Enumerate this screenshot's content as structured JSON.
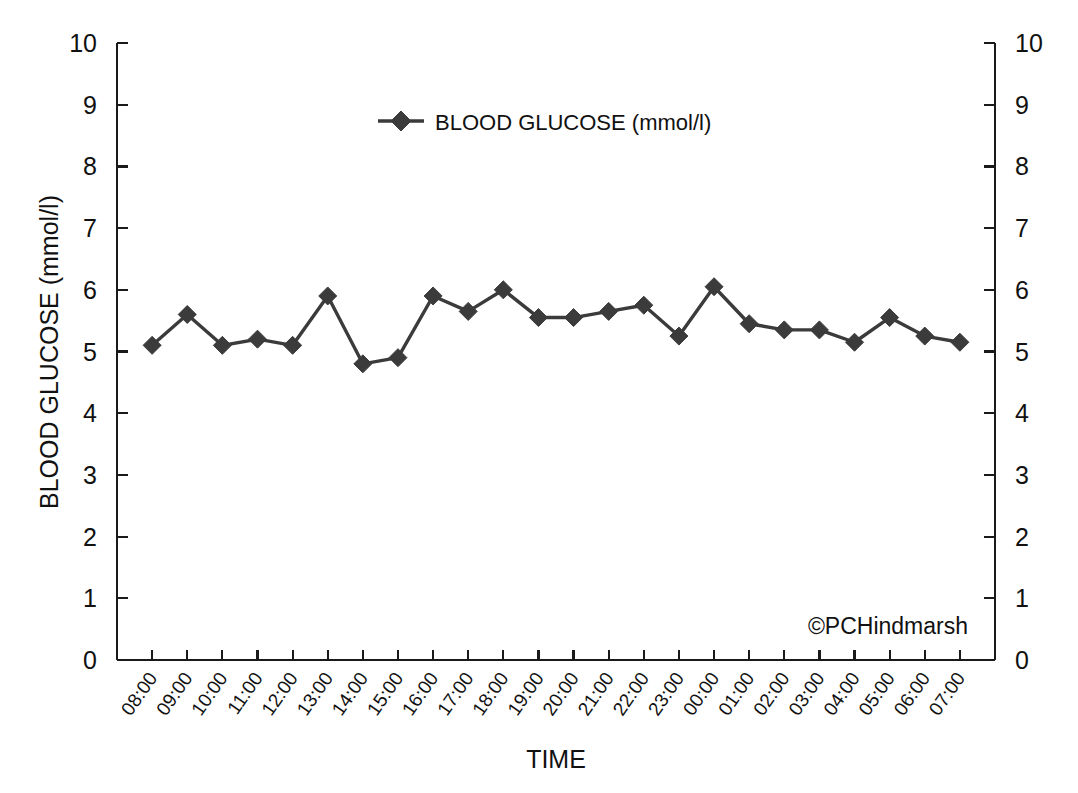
{
  "chart_data": {
    "type": "line",
    "title": "",
    "xlabel": "TIME",
    "ylabel": "BLOOD GLUCOSE (mmol/l)",
    "ylabel_right": "BLOOD GLUCOSE (mmol/l)",
    "ylim": [
      0,
      10
    ],
    "y_ticks": [
      0,
      1,
      2,
      3,
      4,
      5,
      6,
      7,
      8,
      9,
      10
    ],
    "y_tick_labels": [
      "0",
      "1",
      "2",
      "3",
      "4",
      "5",
      "6",
      "7",
      "8",
      "9",
      "10"
    ],
    "dual_y_axis": true,
    "grid": false,
    "legend_position": "top-center",
    "marker": "diamond",
    "line_color": "#3b3b3b",
    "categories": [
      "08:00",
      "09:00",
      "10:00",
      "11:00",
      "12:00",
      "13:00",
      "14:00",
      "15:00",
      "16:00",
      "17:00",
      "18:00",
      "19:00",
      "20:00",
      "21:00",
      "22:00",
      "23:00",
      "00:00",
      "01:00",
      "02:00",
      "03:00",
      "04:00",
      "05:00",
      "06:00",
      "07:00"
    ],
    "series": [
      {
        "name": "BLOOD GLUCOSE (mmol/l)",
        "values": [
          5.1,
          5.6,
          5.1,
          5.2,
          5.1,
          5.9,
          4.8,
          4.9,
          5.9,
          5.65,
          6.0,
          5.55,
          5.55,
          5.65,
          5.75,
          5.25,
          6.05,
          5.45,
          5.35,
          5.35,
          5.15,
          5.55,
          5.25,
          5.15
        ]
      }
    ],
    "annotations": [
      {
        "text": "©PCHindmarsh",
        "position": "bottom-right"
      }
    ]
  },
  "legend": {
    "entries": [
      {
        "label": "BLOOD GLUCOSE (mmol/l)",
        "marker": "diamond-marker",
        "color": "#3b3b3b"
      }
    ]
  },
  "credit": {
    "text": "©PCHindmarsh"
  },
  "axes": {
    "x_title": "TIME",
    "y_title": "BLOOD GLUCOSE (mmol/l)"
  }
}
